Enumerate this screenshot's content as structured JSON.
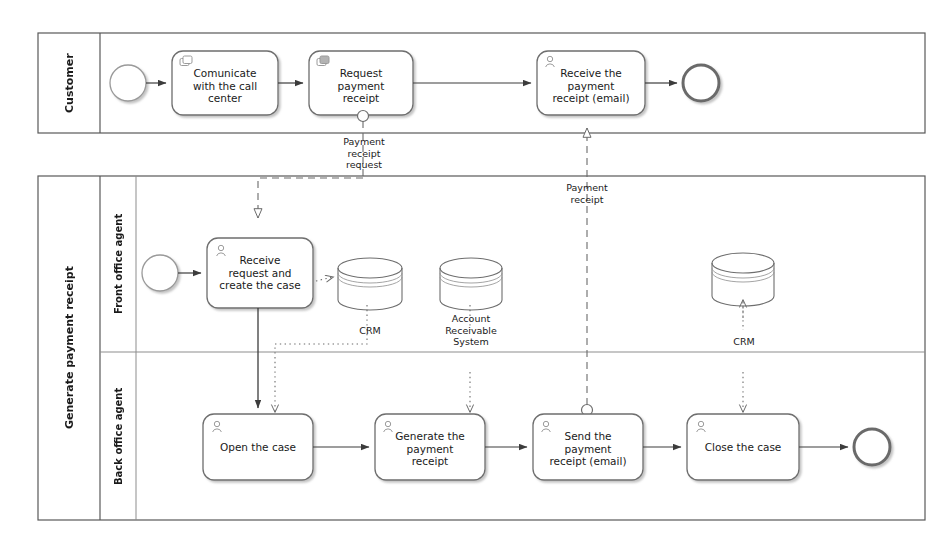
{
  "diagram": {
    "type": "bpmn-collaboration",
    "title": "Generate payment receipt",
    "colors": {
      "stroke": "#6b6b6b",
      "stroke_dark": "#4a4a4a",
      "text": "#1a1a1a",
      "background": "#ffffff",
      "shadow": "#cfcfcf"
    }
  },
  "pools": [
    {
      "id": "pool-customer",
      "label": "Customer",
      "lanes": []
    },
    {
      "id": "pool-generate-payment-receipt",
      "label": "Generate payment receipt",
      "lanes": [
        {
          "id": "lane-front-office",
          "label": "Front office agent"
        },
        {
          "id": "lane-back-office",
          "label": "Back office agent"
        }
      ]
    }
  ],
  "customer_lane": {
    "start_event": {
      "name": "start-event",
      "label": ""
    },
    "tasks": [
      {
        "id": "task-comunicate",
        "lines": [
          "Comunicate",
          "with the call",
          "center"
        ],
        "icon": "user-task-icon"
      },
      {
        "id": "task-request-receipt",
        "lines": [
          "Request",
          "payment",
          "receipt"
        ],
        "icon": "user-task-icon",
        "boundary_event": "message-throw-event"
      },
      {
        "id": "task-receive-receipt",
        "lines": [
          "Receive the",
          "payment",
          "receipt (email)"
        ],
        "icon": "user-task-icon"
      }
    ],
    "end_event": {
      "name": "end-event",
      "label": ""
    }
  },
  "front_office_lane": {
    "start_event": {
      "name": "start-event",
      "label": ""
    },
    "tasks": [
      {
        "id": "task-receive-request",
        "lines": [
          "Receive",
          "request and",
          "create the case"
        ],
        "icon": "user-task-icon"
      }
    ],
    "data_stores": [
      {
        "id": "datastore-crm-left",
        "label": "CRM"
      },
      {
        "id": "datastore-account-receivable",
        "label": "Account\nReceivable\nSystem",
        "lines": [
          "Account",
          "Receivable",
          "System"
        ]
      },
      {
        "id": "datastore-crm-right",
        "label": "CRM"
      }
    ]
  },
  "back_office_lane": {
    "tasks": [
      {
        "id": "task-open-case",
        "lines": [
          "Open the case"
        ],
        "icon": "user-task-icon"
      },
      {
        "id": "task-generate-receipt",
        "lines": [
          "Generate the",
          "payment",
          "receipt"
        ],
        "icon": "user-task-icon"
      },
      {
        "id": "task-send-receipt",
        "lines": [
          "Send the",
          "payment",
          "receipt (email)"
        ],
        "icon": "user-task-icon",
        "boundary_event": "message-throw-event"
      },
      {
        "id": "task-close-case",
        "lines": [
          "Close the case"
        ],
        "icon": "user-task-icon"
      }
    ],
    "end_event": {
      "name": "end-event",
      "label": ""
    }
  },
  "message_flows": [
    {
      "id": "msgflow-payment-receipt-request",
      "lines": [
        "Payment",
        "receipt",
        "request"
      ],
      "from": "task-request-receipt",
      "to": "task-receive-request"
    },
    {
      "id": "msgflow-payment-receipt",
      "lines": [
        "Payment",
        "receipt"
      ],
      "from": "task-send-receipt",
      "to": "task-receive-receipt"
    }
  ],
  "labels": {
    "datastore_crm_left": "CRM",
    "datastore_crm_right": "CRM",
    "datastore_ars_l1": "Account",
    "datastore_ars_l2": "Receivable",
    "datastore_ars_l3": "System",
    "msg1_l1": "Payment",
    "msg1_l2": "receipt",
    "msg1_l3": "request",
    "msg2_l1": "Payment",
    "msg2_l2": "receipt",
    "t1_l1": "Comunicate",
    "t1_l2": "with the call",
    "t1_l3": "center",
    "t2_l1": "Request",
    "t2_l2": "payment",
    "t2_l3": "receipt",
    "t3_l1": "Receive the",
    "t3_l2": "payment",
    "t3_l3": "receipt (email)",
    "t4_l1": "Receive",
    "t4_l2": "request and",
    "t4_l3": "create the case",
    "t5_l1": "Open the case",
    "t6_l1": "Generate the",
    "t6_l2": "payment",
    "t6_l3": "receipt",
    "t7_l1": "Send the",
    "t7_l2": "payment",
    "t7_l3": "receipt (email)",
    "t8_l1": "Close the case"
  }
}
